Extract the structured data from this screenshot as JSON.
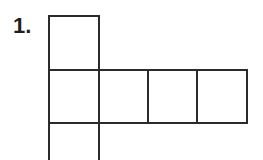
{
  "figure": {
    "label": "1.",
    "label_name": "problem-number",
    "type": "cube-net-polyomino",
    "background_color": "#ffffff",
    "line_color": "#2b2b2b",
    "line_width_px": 2.2,
    "cell_width_px": 50,
    "cell_height_px": 53,
    "grid_origin": {
      "x": 49,
      "y": 16
    },
    "cells": [
      {
        "id": "cell-top",
        "name": "square-top",
        "col": 0,
        "row": 0,
        "x": 49,
        "y": 16,
        "w": 50,
        "h": 54,
        "clipped": false
      },
      {
        "id": "cell-mid-1",
        "name": "square-middle-1",
        "col": 0,
        "row": 1,
        "x": 49,
        "y": 70,
        "w": 50,
        "h": 53,
        "clipped": false
      },
      {
        "id": "cell-mid-2",
        "name": "square-middle-2",
        "col": 1,
        "row": 1,
        "x": 99,
        "y": 70,
        "w": 49,
        "h": 53,
        "clipped": false
      },
      {
        "id": "cell-mid-3",
        "name": "square-middle-3",
        "col": 2,
        "row": 1,
        "x": 148,
        "y": 70,
        "w": 49,
        "h": 53,
        "clipped": false
      },
      {
        "id": "cell-mid-4",
        "name": "square-middle-4",
        "col": 3,
        "row": 1,
        "x": 197,
        "y": 70,
        "w": 50,
        "h": 53,
        "clipped": false
      },
      {
        "id": "cell-bottom",
        "name": "square-bottom",
        "col": 0,
        "row": 2,
        "x": 49,
        "y": 123,
        "w": 50,
        "h": 37,
        "clipped": true
      }
    ],
    "cell_count_visible": 6,
    "row_counts": [
      1,
      4,
      1
    ]
  }
}
